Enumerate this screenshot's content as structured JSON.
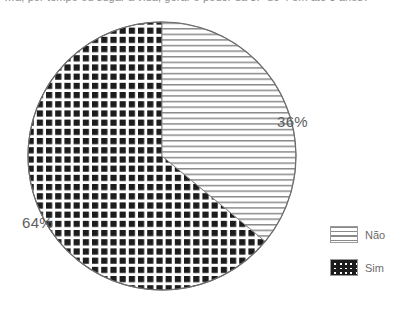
{
  "caption": {
    "text": "…a, por tempo ou sugar a vida, gerar o poder da 3.ª de 4 em até 3 anos?"
  },
  "chart_data": {
    "type": "pie",
    "title": "",
    "labels": [
      "Não",
      "Sim"
    ],
    "values": [
      36,
      64
    ],
    "value_labels": [
      "36%",
      "64%"
    ],
    "units": "percent",
    "start_angle_deg": 0,
    "direction": "clockwise",
    "legend_position": "right",
    "grid": false,
    "slices": [
      {
        "name": "Não",
        "value": 36,
        "display_value": "36%",
        "pattern": "horizontal-lines",
        "pattern_color": "#777777",
        "fill_color": "#ffffff"
      },
      {
        "name": "Sim",
        "value": 64,
        "display_value": "64%",
        "pattern": "checkerboard",
        "pattern_color": "#1a1a1a",
        "fill_color": "#ffffff"
      }
    ]
  },
  "labels": {
    "nao_percent": "36%",
    "sim_percent": "64%"
  },
  "legend": {
    "items": [
      {
        "label": "Não",
        "pattern": "horizontal-lines"
      },
      {
        "label": "Sim",
        "pattern": "checkerboard"
      }
    ]
  },
  "colors": {
    "outline": "#6e6e6e",
    "text": "#5e5e5e",
    "legend_text": "#6b6b6b",
    "background": "#ffffff"
  },
  "geometry": {
    "center_x": 162,
    "center_y": 156,
    "radius": 134
  }
}
